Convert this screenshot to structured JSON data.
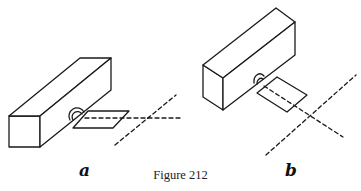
{
  "figure": {
    "caption": "Figure 212",
    "panels": [
      {
        "id": "a",
        "label": "a"
      },
      {
        "id": "b",
        "label": "b"
      }
    ],
    "colors": {
      "ink": "#1a1a1a",
      "background": "#ffffff"
    }
  }
}
